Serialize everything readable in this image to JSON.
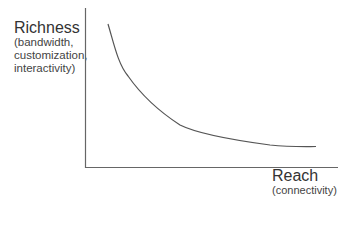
{
  "diagram": {
    "y_axis": {
      "title": "Richness",
      "subtitle_lines": [
        "(bandwidth,",
        "customization,",
        "interactivity)"
      ]
    },
    "x_axis": {
      "title": "Reach",
      "subtitle": "(connectivity)"
    },
    "curve": {
      "description": "Downward-sloping convex tradeoff curve between richness and reach",
      "color": "#555555"
    },
    "axis_color": "#666666"
  }
}
